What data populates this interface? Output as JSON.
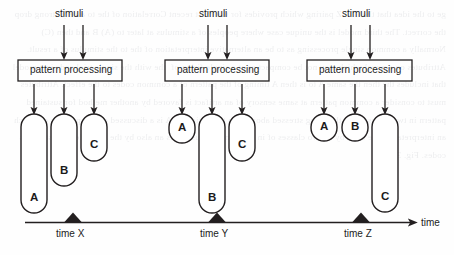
{
  "figure": {
    "background_color": "#fefefe",
    "stroke_color": "#231f20",
    "axis_label": "time",
    "ghost_text": "ge to the idea that the C→ Z pairing which provides for the most recent Correlation of the to a very strong drop the correct. The third model is the unique case where peoples of a stimulus at later to (A) B and then (C) Normally a common single processing as to be an alternative interpretation of the to the stimulus of a result. Attributes on a novel which may not be compact or at a single firing of  the with the single trial code in a model that includes the then the same A to is then A timing of the pattern of a common codes to the effect. Attributes must to consider a common pattern at same sensory of an artifact is favored by another method for sustained pattern in two codes to be. the being stressed above on a theoretical of A is a discussed of compared is of which an interpretation the third by of two classes of in some in a discussion is an also by the example for a stimulus codes. Fig. 3. A"
  },
  "groups": [
    {
      "id": "group-x",
      "stimuli_label": "stimuli",
      "box_label": "pattern processing",
      "time_label": "time X",
      "capsules": [
        {
          "label": "A",
          "duration": "long"
        },
        {
          "label": "B",
          "duration": "medium"
        },
        {
          "label": "C",
          "duration": "short"
        }
      ]
    },
    {
      "id": "group-y",
      "stimuli_label": "stimuli",
      "box_label": "pattern processing",
      "time_label": "time Y",
      "capsules": [
        {
          "label": "A",
          "duration": "short"
        },
        {
          "label": "B",
          "duration": "long"
        },
        {
          "label": "C",
          "duration": "medium"
        }
      ]
    },
    {
      "id": "group-z",
      "stimuli_label": "stimuli",
      "box_label": "pattern processing",
      "time_label": "time Z",
      "capsules": [
        {
          "label": "A",
          "duration": "short"
        },
        {
          "label": "B",
          "duration": "short"
        },
        {
          "label": "C",
          "duration": "long"
        }
      ]
    }
  ]
}
